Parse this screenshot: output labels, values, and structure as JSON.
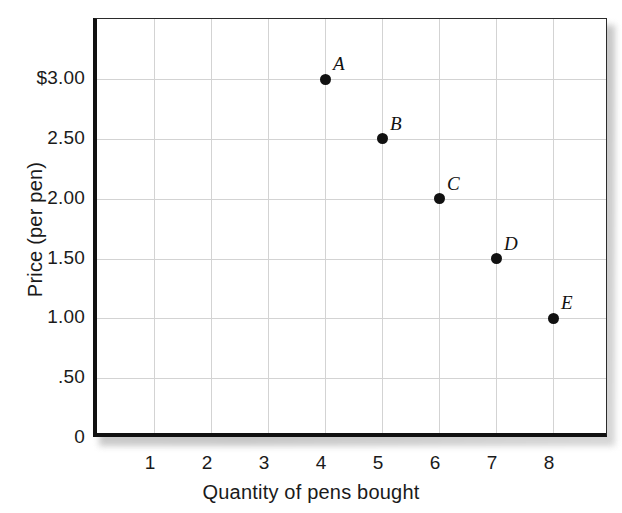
{
  "chart_data": {
    "type": "scatter",
    "title": "",
    "xlabel": "Quantity of pens bought",
    "ylabel": "Price (per pen)",
    "xlim": [
      0,
      9
    ],
    "ylim": [
      0,
      3.5
    ],
    "grid": true,
    "legend": "none",
    "x_ticks": [
      "1",
      "2",
      "3",
      "4",
      "5",
      "6",
      "7",
      "8"
    ],
    "x_tick_values": [
      1,
      2,
      3,
      4,
      5,
      6,
      7,
      8
    ],
    "y_ticks": [
      "0",
      ".50",
      "1.00",
      "1.50",
      "2.00",
      "2.50",
      "$3.00"
    ],
    "y_tick_values": [
      0,
      0.5,
      1.0,
      1.5,
      2.0,
      2.5,
      3.0
    ],
    "points": [
      {
        "label": "A",
        "x": 4,
        "y": 3.0
      },
      {
        "label": "B",
        "x": 5,
        "y": 2.5
      },
      {
        "label": "C",
        "x": 6,
        "y": 2.0
      },
      {
        "label": "D",
        "x": 7,
        "y": 1.5
      },
      {
        "label": "E",
        "x": 8,
        "y": 1.0
      }
    ],
    "colors": {
      "point": "#111111",
      "axis": "#111111",
      "grid": "#d3d3d3",
      "text": "#1a1a1a",
      "background": "#ffffff"
    }
  }
}
